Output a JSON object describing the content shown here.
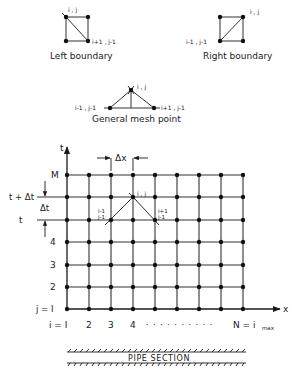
{
  "left_boundary": {
    "caption": "Left boundary",
    "node_top_label": "i , j",
    "node_br_label": "i+1 , j-1"
  },
  "right_boundary": {
    "caption": "Right boundary",
    "node_top_label": "i , j",
    "node_bl_label": "i-1 , j-1"
  },
  "general_mesh": {
    "caption": "General mesh point",
    "apex_label": "i , j",
    "left_label": "i-1 , j-1",
    "right_label": "i+1 , j-1"
  },
  "grid": {
    "t_axis_label": "t",
    "x_axis_label": "x",
    "delta_x_label": "Δx",
    "delta_t_label": "Δt",
    "row_labels": {
      "M": "M",
      "t_plus_dt": "t + Δt",
      "t": "t",
      "r4": "4",
      "r3": "3",
      "r2": "2",
      "j1": "j = I"
    },
    "col_labels": {
      "i1": "i = I",
      "c2": "2",
      "c3": "3",
      "c4": "4",
      "dots": "· · · · · · · · · ·",
      "N": "N = i",
      "N_sub": "max"
    },
    "point_ij": "i , j",
    "point_left_a": "i-1",
    "point_left_b": "j-1",
    "point_right_a": "i+1",
    "point_right_b": "j-1"
  },
  "pipe": {
    "label": "PIPE SECTION"
  }
}
